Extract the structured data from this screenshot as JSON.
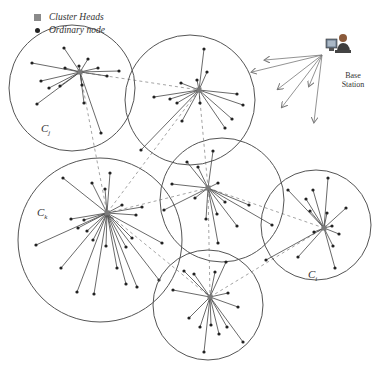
{
  "legend": {
    "cluster_heads_label": "Cluster Heads",
    "ordinary_node_label": "Ordinary node"
  },
  "base_station": {
    "label_line1": "Base",
    "label_line2": "Station",
    "icon": "computer-user-icon"
  },
  "cluster_labels": {
    "cj": {
      "main": "C",
      "sub": "j"
    },
    "ck": {
      "main": "C",
      "sub": "k"
    },
    "ci": {
      "main": "C",
      "sub": "i"
    }
  },
  "colors": {
    "circle": "#555555",
    "edge": "#444444",
    "dashed": "#9a9a9a",
    "node": "#222222",
    "cluster_head": "#7a7a7a"
  },
  "clusters": [
    {
      "id": "Cj",
      "cx": 72,
      "cy": 88,
      "r": 63,
      "head": [
        80,
        72
      ],
      "nodes": [
        [
          64,
          48
        ],
        [
          32,
          63
        ],
        [
          88,
          59
        ],
        [
          119,
          71
        ],
        [
          98,
          68
        ],
        [
          79,
          66
        ],
        [
          65,
          68
        ],
        [
          41,
          81
        ],
        [
          49,
          88
        ],
        [
          60,
          86
        ],
        [
          82,
          85
        ],
        [
          107,
          76
        ],
        [
          37,
          104
        ],
        [
          84,
          103
        ],
        [
          101,
          133
        ]
      ]
    },
    {
      "id": "C2",
      "cx": 190,
      "cy": 100,
      "r": 65,
      "head": [
        199,
        90
      ],
      "nodes": [
        [
          204,
          49
        ],
        [
          207,
          72
        ],
        [
          197,
          80
        ],
        [
          181,
          83
        ],
        [
          154,
          97
        ],
        [
          170,
          99
        ],
        [
          177,
          103
        ],
        [
          200,
          103
        ],
        [
          237,
          94
        ],
        [
          243,
          105
        ],
        [
          232,
          119
        ],
        [
          225,
          128
        ],
        [
          182,
          121
        ],
        [
          141,
          150
        ]
      ]
    },
    {
      "id": "Ck",
      "cx": 100,
      "cy": 240,
      "r": 82,
      "head": [
        107,
        213
      ],
      "nodes": [
        [
          63,
          178
        ],
        [
          92,
          183
        ],
        [
          110,
          173
        ],
        [
          105,
          189
        ],
        [
          122,
          205
        ],
        [
          142,
          207
        ],
        [
          136,
          215
        ],
        [
          71,
          219
        ],
        [
          84,
          220
        ],
        [
          78,
          228
        ],
        [
          87,
          231
        ],
        [
          36,
          245
        ],
        [
          93,
          240
        ],
        [
          106,
          246
        ],
        [
          132,
          238
        ],
        [
          126,
          247
        ],
        [
          162,
          243
        ],
        [
          61,
          268
        ],
        [
          117,
          268
        ],
        [
          77,
          292
        ],
        [
          94,
          294
        ],
        [
          126,
          284
        ],
        [
          137,
          287
        ],
        [
          159,
          280
        ]
      ]
    },
    {
      "id": "C4",
      "cx": 222,
      "cy": 200,
      "r": 62,
      "head": [
        208,
        188
      ],
      "nodes": [
        [
          213,
          151
        ],
        [
          187,
          162
        ],
        [
          198,
          167
        ],
        [
          172,
          184
        ],
        [
          218,
          183
        ],
        [
          195,
          198
        ],
        [
          225,
          202
        ],
        [
          164,
          210
        ],
        [
          249,
          205
        ],
        [
          206,
          219
        ],
        [
          217,
          214
        ],
        [
          237,
          226
        ],
        [
          272,
          225
        ],
        [
          218,
          243
        ]
      ]
    },
    {
      "id": "Ci",
      "cx": 316,
      "cy": 225,
      "r": 55,
      "head": [
        324,
        228
      ],
      "nodes": [
        [
          328,
          178
        ],
        [
          288,
          190
        ],
        [
          313,
          190
        ],
        [
          306,
          199
        ],
        [
          310,
          211
        ],
        [
          346,
          208
        ],
        [
          327,
          213
        ],
        [
          332,
          226
        ],
        [
          314,
          232
        ],
        [
          339,
          234
        ],
        [
          333,
          246
        ],
        [
          298,
          257
        ],
        [
          266,
          260
        ],
        [
          335,
          268
        ]
      ]
    },
    {
      "id": "C6",
      "cx": 208,
      "cy": 305,
      "r": 55,
      "head": [
        210,
        297
      ],
      "nodes": [
        [
          226,
          262
        ],
        [
          184,
          271
        ],
        [
          194,
          274
        ],
        [
          215,
          272
        ],
        [
          173,
          290
        ],
        [
          228,
          293
        ],
        [
          238,
          307
        ],
        [
          189,
          318
        ],
        [
          200,
          327
        ],
        [
          211,
          325
        ],
        [
          227,
          327
        ],
        [
          219,
          334
        ],
        [
          243,
          342
        ],
        [
          204,
          352
        ]
      ]
    }
  ],
  "dashed_links": [
    [
      [
        80,
        72
      ],
      [
        199,
        90
      ]
    ],
    [
      [
        80,
        72
      ],
      [
        107,
        213
      ]
    ],
    [
      [
        199,
        90
      ],
      [
        107,
        213
      ]
    ],
    [
      [
        199,
        90
      ],
      [
        208,
        188
      ]
    ],
    [
      [
        107,
        213
      ],
      [
        208,
        188
      ]
    ],
    [
      [
        107,
        213
      ],
      [
        210,
        297
      ]
    ],
    [
      [
        208,
        188
      ],
      [
        324,
        228
      ]
    ],
    [
      [
        210,
        297
      ],
      [
        324,
        228
      ]
    ],
    [
      [
        208,
        188
      ],
      [
        210,
        297
      ]
    ]
  ],
  "bs_arrows": {
    "origin": [
      322,
      55
    ],
    "targets": [
      [
        265,
        60
      ],
      [
        252,
        72
      ],
      [
        278,
        89
      ],
      [
        309,
        86
      ],
      [
        282,
        107
      ],
      [
        314,
        122
      ]
    ]
  }
}
